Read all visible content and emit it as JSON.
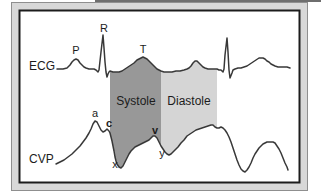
{
  "labels": {
    "ecg": "ECG",
    "cvp": "CVP",
    "systole": "Systole",
    "diastole": "Diastole",
    "p_wave": "P",
    "r_wave": "R",
    "t_wave": "T",
    "a_wave": "a",
    "c_wave": "c",
    "v_wave": "v",
    "x_descent": "x",
    "y_descent": "y"
  },
  "colors": {
    "page_bg": "#ffffff",
    "scan_artifact": "#6e6e6e",
    "frame_fill": "#d8d8d8",
    "frame_edge": "#8f8f8f",
    "panel_fill": "#ffffff",
    "panel_border": "#1c1c1c",
    "systole_fill": "#989898",
    "diastole_fill": "#d5d5d5",
    "trace": "#383838",
    "label_text": "#1c1c1c"
  },
  "waveforms": {
    "ecg": [
      [
        57,
        69
      ],
      [
        63,
        69
      ],
      [
        67,
        68
      ],
      [
        70,
        65
      ],
      [
        72,
        62
      ],
      [
        74,
        60
      ],
      [
        76,
        59
      ],
      [
        78,
        60
      ],
      [
        80,
        63
      ],
      [
        82,
        65
      ],
      [
        84,
        67
      ],
      [
        86,
        68
      ],
      [
        89,
        69
      ],
      [
        92,
        69
      ],
      [
        94,
        69
      ],
      [
        96,
        70
      ],
      [
        98,
        72
      ],
      [
        99,
        70
      ],
      [
        101,
        52
      ],
      [
        103,
        35
      ],
      [
        104,
        48
      ],
      [
        105,
        62
      ],
      [
        106,
        72
      ],
      [
        107,
        77
      ],
      [
        108,
        74
      ],
      [
        109,
        72
      ],
      [
        110,
        71
      ],
      [
        113,
        72
      ],
      [
        116,
        72
      ],
      [
        119,
        72
      ],
      [
        122,
        71
      ],
      [
        125,
        69
      ],
      [
        128,
        67
      ],
      [
        131,
        65
      ],
      [
        134,
        63
      ],
      [
        137,
        60
      ],
      [
        139,
        59
      ],
      [
        141,
        58
      ],
      [
        143,
        57
      ],
      [
        145,
        58
      ],
      [
        147,
        59
      ],
      [
        149,
        61
      ],
      [
        151,
        63
      ],
      [
        153,
        65
      ],
      [
        155,
        67
      ],
      [
        157,
        69
      ],
      [
        159,
        70
      ],
      [
        161,
        71
      ],
      [
        164,
        72
      ],
      [
        168,
        72
      ],
      [
        172,
        72
      ],
      [
        176,
        71
      ],
      [
        180,
        71
      ],
      [
        184,
        70
      ],
      [
        187,
        69
      ],
      [
        189,
        68
      ],
      [
        191,
        66
      ],
      [
        193,
        63
      ],
      [
        195,
        61
      ],
      [
        197,
        61
      ],
      [
        199,
        63
      ],
      [
        201,
        65
      ],
      [
        203,
        67
      ],
      [
        205,
        68
      ],
      [
        208,
        69
      ],
      [
        211,
        69
      ],
      [
        214,
        69
      ],
      [
        217,
        69
      ],
      [
        219,
        70
      ],
      [
        221,
        70
      ],
      [
        223,
        72
      ],
      [
        224,
        69
      ],
      [
        225,
        55
      ],
      [
        227,
        38
      ],
      [
        228,
        52
      ],
      [
        229,
        70
      ],
      [
        230,
        78
      ],
      [
        232,
        73
      ],
      [
        233,
        70
      ],
      [
        235,
        69
      ],
      [
        238,
        68
      ],
      [
        241,
        68
      ],
      [
        244,
        67
      ],
      [
        247,
        66
      ],
      [
        250,
        64
      ],
      [
        253,
        62
      ],
      [
        256,
        60
      ],
      [
        259,
        58
      ],
      [
        261,
        58
      ],
      [
        263,
        58
      ],
      [
        265,
        59
      ],
      [
        267,
        61
      ],
      [
        269,
        62
      ],
      [
        271,
        64
      ],
      [
        273,
        65
      ],
      [
        275,
        66
      ],
      [
        278,
        67
      ],
      [
        281,
        67
      ],
      [
        284,
        67
      ],
      [
        287,
        67
      ],
      [
        290,
        68
      ]
    ],
    "cvp": [
      [
        56,
        164
      ],
      [
        60,
        162
      ],
      [
        64,
        160
      ],
      [
        68,
        157
      ],
      [
        72,
        154
      ],
      [
        76,
        150
      ],
      [
        80,
        146
      ],
      [
        83,
        142
      ],
      [
        86,
        138
      ],
      [
        89,
        133
      ],
      [
        91,
        129
      ],
      [
        93,
        124
      ],
      [
        95,
        121
      ],
      [
        97,
        122
      ],
      [
        99,
        126
      ],
      [
        101,
        130
      ],
      [
        103,
        132
      ],
      [
        105,
        131
      ],
      [
        107,
        129
      ],
      [
        109,
        131
      ],
      [
        110,
        133
      ],
      [
        111,
        137
      ],
      [
        112,
        141
      ],
      [
        113,
        146
      ],
      [
        114,
        151
      ],
      [
        115,
        157
      ],
      [
        116,
        161
      ],
      [
        117,
        164
      ],
      [
        119,
        167
      ],
      [
        121,
        168
      ],
      [
        123,
        166
      ],
      [
        125,
        162
      ],
      [
        127,
        158
      ],
      [
        129,
        154
      ],
      [
        131,
        151
      ],
      [
        133,
        149
      ],
      [
        135,
        147
      ],
      [
        137,
        146
      ],
      [
        139,
        145
      ],
      [
        141,
        144
      ],
      [
        143,
        143
      ],
      [
        145,
        142
      ],
      [
        147,
        141
      ],
      [
        149,
        140
      ],
      [
        151,
        138
      ],
      [
        153,
        136
      ],
      [
        155,
        136
      ],
      [
        157,
        138
      ],
      [
        159,
        142
      ],
      [
        161,
        146
      ],
      [
        163,
        149
      ],
      [
        165,
        152
      ],
      [
        167,
        154
      ],
      [
        169,
        155
      ],
      [
        171,
        154
      ],
      [
        173,
        152
      ],
      [
        175,
        150
      ],
      [
        178,
        147
      ],
      [
        181,
        143
      ],
      [
        184,
        140
      ],
      [
        187,
        136
      ],
      [
        190,
        134
      ],
      [
        193,
        132
      ],
      [
        196,
        130
      ],
      [
        199,
        129
      ],
      [
        202,
        128
      ],
      [
        205,
        127
      ],
      [
        208,
        126
      ],
      [
        211,
        125
      ],
      [
        213,
        125
      ],
      [
        215,
        127
      ],
      [
        217,
        128
      ],
      [
        219,
        128
      ],
      [
        221,
        127
      ],
      [
        223,
        128
      ],
      [
        225,
        130
      ],
      [
        227,
        133
      ],
      [
        229,
        137
      ],
      [
        231,
        142
      ],
      [
        233,
        148
      ],
      [
        235,
        154
      ],
      [
        237,
        160
      ],
      [
        239,
        165
      ],
      [
        241,
        169
      ],
      [
        243,
        171
      ],
      [
        245,
        172
      ],
      [
        247,
        170
      ],
      [
        249,
        167
      ],
      [
        251,
        163
      ],
      [
        253,
        158
      ],
      [
        255,
        154
      ],
      [
        257,
        151
      ],
      [
        259,
        148
      ],
      [
        261,
        146
      ],
      [
        263,
        144
      ],
      [
        265,
        143
      ],
      [
        267,
        142
      ],
      [
        269,
        142
      ],
      [
        271,
        142
      ],
      [
        273,
        142
      ],
      [
        275,
        143
      ],
      [
        277,
        146
      ],
      [
        279,
        149
      ],
      [
        281,
        153
      ],
      [
        283,
        158
      ],
      [
        285,
        163
      ],
      [
        287,
        167
      ],
      [
        288,
        170
      ]
    ],
    "systole_region": [
      [
        110,
        71
      ],
      [
        110,
        133
      ],
      [
        111,
        137
      ],
      [
        112,
        141
      ],
      [
        113,
        146
      ],
      [
        114,
        151
      ],
      [
        115,
        157
      ],
      [
        116,
        161
      ],
      [
        117,
        164
      ],
      [
        119,
        167
      ],
      [
        121,
        168
      ],
      [
        123,
        166
      ],
      [
        125,
        162
      ],
      [
        127,
        158
      ],
      [
        129,
        154
      ],
      [
        131,
        151
      ],
      [
        133,
        149
      ],
      [
        135,
        147
      ],
      [
        137,
        146
      ],
      [
        139,
        145
      ],
      [
        141,
        144
      ],
      [
        143,
        143
      ],
      [
        145,
        142
      ],
      [
        147,
        141
      ],
      [
        149,
        140
      ],
      [
        151,
        138
      ],
      [
        153,
        136
      ],
      [
        155,
        136
      ],
      [
        157,
        138
      ],
      [
        159,
        142
      ],
      [
        161,
        146
      ],
      [
        161,
        71
      ],
      [
        159,
        70
      ],
      [
        157,
        69
      ],
      [
        155,
        67
      ],
      [
        153,
        65
      ],
      [
        151,
        63
      ],
      [
        149,
        61
      ],
      [
        147,
        59
      ],
      [
        145,
        58
      ],
      [
        143,
        57
      ],
      [
        141,
        58
      ],
      [
        139,
        59
      ],
      [
        137,
        60
      ],
      [
        134,
        63
      ],
      [
        131,
        65
      ],
      [
        128,
        67
      ],
      [
        125,
        69
      ],
      [
        122,
        71
      ],
      [
        119,
        72
      ],
      [
        116,
        72
      ],
      [
        113,
        72
      ]
    ],
    "diastole_region": [
      [
        161,
        71
      ],
      [
        161,
        146
      ],
      [
        163,
        149
      ],
      [
        165,
        152
      ],
      [
        167,
        154
      ],
      [
        169,
        155
      ],
      [
        171,
        154
      ],
      [
        173,
        152
      ],
      [
        175,
        150
      ],
      [
        178,
        147
      ],
      [
        181,
        143
      ],
      [
        184,
        140
      ],
      [
        187,
        136
      ],
      [
        190,
        134
      ],
      [
        193,
        132
      ],
      [
        196,
        130
      ],
      [
        199,
        129
      ],
      [
        202,
        128
      ],
      [
        205,
        127
      ],
      [
        208,
        126
      ],
      [
        211,
        125
      ],
      [
        213,
        125
      ],
      [
        215,
        127
      ],
      [
        217,
        128
      ],
      [
        217,
        69
      ],
      [
        214,
        69
      ],
      [
        211,
        69
      ],
      [
        208,
        69
      ],
      [
        205,
        68
      ],
      [
        203,
        67
      ],
      [
        201,
        65
      ],
      [
        199,
        63
      ],
      [
        197,
        61
      ],
      [
        195,
        61
      ],
      [
        193,
        63
      ],
      [
        191,
        66
      ],
      [
        189,
        68
      ],
      [
        187,
        69
      ],
      [
        184,
        70
      ],
      [
        180,
        71
      ],
      [
        176,
        71
      ],
      [
        172,
        72
      ],
      [
        168,
        72
      ],
      [
        164,
        72
      ]
    ]
  }
}
